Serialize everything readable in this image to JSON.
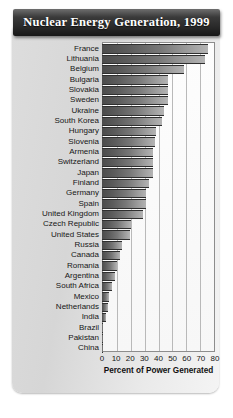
{
  "title": "Nuclear Energy Generation, 1999",
  "chart_data": {
    "type": "bar",
    "orientation": "horizontal",
    "title": "Nuclear Energy Generation, 1999",
    "xlabel": "Percent of Power Generated",
    "ylabel": "",
    "xlim": [
      0,
      80
    ],
    "xticks": [
      0,
      10,
      20,
      30,
      40,
      50,
      60,
      70,
      80
    ],
    "grid": true,
    "legend": "none",
    "categories": [
      "France",
      "Lithuania",
      "Belgium",
      "Bulgaria",
      "Slovakia",
      "Sweden",
      "Ukraine",
      "South Korea",
      "Hungary",
      "Slovenia",
      "Armenia",
      "Switzerland",
      "Japan",
      "Finland",
      "Germany",
      "Spain",
      "United Kingdom",
      "Czech Republic",
      "United States",
      "Russia",
      "Canada",
      "Romania",
      "Argentina",
      "South Africa",
      "Mexico",
      "Netherlands",
      "India",
      "Brazil",
      "Pakistan",
      "China"
    ],
    "values": [
      75,
      73,
      58,
      47,
      47,
      46.8,
      43.8,
      42.8,
      38.3,
      37.2,
      36.4,
      36,
      36,
      33,
      31.2,
      31,
      28.9,
      20.8,
      19.8,
      14.4,
      12.4,
      10.7,
      9,
      7.1,
      5.2,
      4.1,
      2.6,
      1,
      0.8,
      0.8
    ]
  }
}
